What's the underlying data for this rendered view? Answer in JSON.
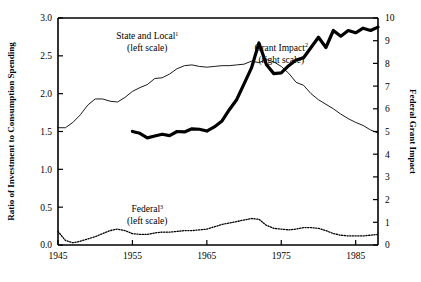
{
  "chart_data": {
    "type": "line",
    "title": "",
    "subtitle": "",
    "xlabel": "",
    "ylabel": "Ratio of Investment to Consumption Spending",
    "y2label": "Federal Grant Impact",
    "xlim": [
      1945,
      1988
    ],
    "ylim": [
      0.0,
      3.0
    ],
    "y2lim": [
      0,
      10
    ],
    "grid": false,
    "legend_position": "inline-annotations",
    "xticks": [
      1945,
      1955,
      1965,
      1975,
      1985
    ],
    "xtick_labels": [
      "1945",
      "1955",
      "1965",
      "1975",
      "1985"
    ],
    "yticks": [
      0.0,
      0.5,
      1.0,
      1.5,
      2.0,
      2.5,
      3.0
    ],
    "ytick_labels": [
      "0.0",
      "0.5",
      "1.0",
      "1.5",
      "2.0",
      "2.5",
      "3.0"
    ],
    "y2ticks": [
      0,
      1,
      2,
      3,
      4,
      5,
      6,
      7,
      8,
      9,
      10
    ],
    "y2tick_labels": [
      "0",
      "1",
      "2",
      "3",
      "4",
      "5",
      "6",
      "7",
      "8",
      "9",
      "10"
    ],
    "series": [
      {
        "name": "State and Local",
        "footnote": "1",
        "scale": "left",
        "scale_note": "(left scale)",
        "style": "thin-solid",
        "label_x": 1957,
        "label_y": 2.72,
        "x": [
          1945,
          1946,
          1947,
          1948,
          1949,
          1950,
          1951,
          1952,
          1953,
          1954,
          1955,
          1956,
          1957,
          1958,
          1959,
          1960,
          1961,
          1962,
          1963,
          1964,
          1965,
          1966,
          1967,
          1968,
          1969,
          1970,
          1971,
          1972,
          1973,
          1974,
          1975,
          1976,
          1977,
          1978,
          1979,
          1980,
          1981,
          1982,
          1983,
          1984,
          1985,
          1986,
          1987,
          1988
        ],
        "y": [
          1.55,
          1.55,
          1.62,
          1.72,
          1.85,
          1.93,
          1.93,
          1.9,
          1.89,
          1.95,
          2.03,
          2.08,
          2.12,
          2.2,
          2.21,
          2.26,
          2.33,
          2.37,
          2.38,
          2.36,
          2.35,
          2.36,
          2.37,
          2.37,
          2.38,
          2.39,
          2.43,
          2.41,
          2.45,
          2.42,
          2.36,
          2.27,
          2.15,
          2.11,
          2.0,
          1.92,
          1.86,
          1.8,
          1.73,
          1.67,
          1.62,
          1.58,
          1.52,
          1.48
        ]
      },
      {
        "name": "Grant Impact",
        "footnote": "2",
        "scale": "right",
        "scale_note": "(right scale)",
        "style": "thick-solid",
        "label_x": 1975,
        "label_y": 8.55,
        "x": [
          1955,
          1956,
          1957,
          1958,
          1959,
          1960,
          1961,
          1962,
          1963,
          1964,
          1965,
          1966,
          1967,
          1968,
          1969,
          1970,
          1971,
          1972,
          1973,
          1974,
          1975,
          1976,
          1977,
          1978,
          1979,
          1980,
          1981,
          1982,
          1983,
          1984,
          1985,
          1986,
          1987,
          1988
        ],
        "y": [
          5.0,
          4.92,
          4.72,
          4.8,
          4.88,
          4.82,
          5.0,
          4.98,
          5.12,
          5.1,
          5.02,
          5.2,
          5.45,
          5.95,
          6.4,
          7.1,
          7.8,
          8.9,
          7.95,
          7.55,
          7.58,
          7.9,
          8.15,
          8.25,
          8.7,
          9.15,
          8.7,
          9.45,
          9.2,
          9.45,
          9.35,
          9.55,
          9.45,
          9.6
        ]
      },
      {
        "name": "Federal",
        "footnote": "3",
        "scale": "left",
        "scale_note": "(left scale)",
        "style": "dotted",
        "label_x": 1957,
        "label_y": 0.43,
        "x": [
          1945,
          1946,
          1947,
          1948,
          1949,
          1950,
          1951,
          1952,
          1953,
          1954,
          1955,
          1956,
          1957,
          1958,
          1959,
          1960,
          1961,
          1962,
          1963,
          1964,
          1965,
          1966,
          1967,
          1968,
          1969,
          1970,
          1971,
          1972,
          1973,
          1974,
          1975,
          1976,
          1977,
          1978,
          1979,
          1980,
          1981,
          1982,
          1983,
          1984,
          1985,
          1986,
          1987,
          1988
        ],
        "y": [
          0.18,
          0.06,
          0.03,
          0.05,
          0.08,
          0.11,
          0.15,
          0.19,
          0.21,
          0.19,
          0.15,
          0.14,
          0.14,
          0.16,
          0.17,
          0.17,
          0.18,
          0.19,
          0.19,
          0.2,
          0.21,
          0.24,
          0.27,
          0.29,
          0.31,
          0.33,
          0.35,
          0.34,
          0.26,
          0.22,
          0.21,
          0.2,
          0.21,
          0.23,
          0.23,
          0.22,
          0.19,
          0.15,
          0.13,
          0.12,
          0.12,
          0.12,
          0.13,
          0.14
        ]
      }
    ]
  }
}
